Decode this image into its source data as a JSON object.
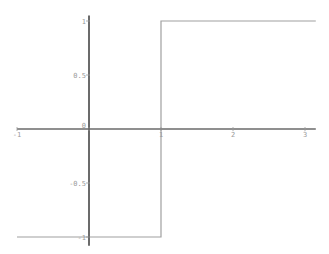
{
  "chart_data": {
    "type": "line",
    "title": "",
    "xlabel": "",
    "ylabel": "",
    "xlim": [
      -1,
      3.15
    ],
    "ylim": [
      -1.08,
      1.05
    ],
    "grid": false,
    "legend": null,
    "x_ticks": [
      {
        "value": -1,
        "label": "-1"
      },
      {
        "value": 0,
        "label": "0"
      },
      {
        "value": 1,
        "label": "1"
      },
      {
        "value": 2,
        "label": "2"
      },
      {
        "value": 3,
        "label": "3"
      }
    ],
    "y_ticks": [
      {
        "value": 1,
        "label": "1"
      },
      {
        "value": 0.5,
        "label": "0.5"
      },
      {
        "value": -0.5,
        "label": "-0.5"
      },
      {
        "value": -1,
        "label": "-1"
      }
    ],
    "series": [
      {
        "name": "step function",
        "x": [
          -1,
          1,
          1,
          3.15
        ],
        "y": [
          -1,
          -1,
          1,
          1
        ]
      }
    ],
    "colors": {
      "x_axis": "#6a6a6a",
      "y_axis": "#3a3a3a",
      "series": "#a0a0a0",
      "ticks": "#9a9a9a"
    }
  }
}
